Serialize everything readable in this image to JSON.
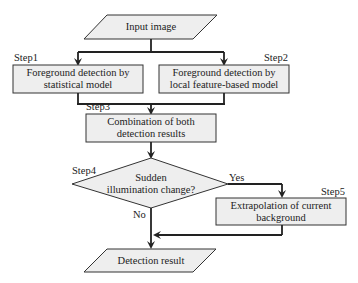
{
  "diagram": {
    "type": "flowchart",
    "nodes": {
      "input": {
        "shape": "parallelogram",
        "text": "Input image"
      },
      "step1": {
        "step_label": "Step1",
        "shape": "rectangle",
        "line1": "Foreground detection by",
        "line2": "statistical model"
      },
      "step2": {
        "step_label": "Step2",
        "shape": "rectangle",
        "line1": "Foreground detection by",
        "line2": "local feature-based model"
      },
      "step3": {
        "step_label": "Step3",
        "shape": "rectangle",
        "line1": "Combination of both",
        "line2": "detection results"
      },
      "step4": {
        "step_label": "Step4",
        "shape": "diamond",
        "line1": "Sudden",
        "line2": "illumination change?"
      },
      "step5": {
        "step_label": "Step5",
        "shape": "rectangle",
        "line1": "Extrapolation of current",
        "line2": "background"
      },
      "output": {
        "shape": "parallelogram",
        "text": "Detection result"
      }
    },
    "edges": {
      "yes_label": "Yes",
      "no_label": "No"
    },
    "colors": {
      "box_fill": "#eeeeee",
      "stroke": "#222222",
      "background": "#ffffff"
    }
  }
}
